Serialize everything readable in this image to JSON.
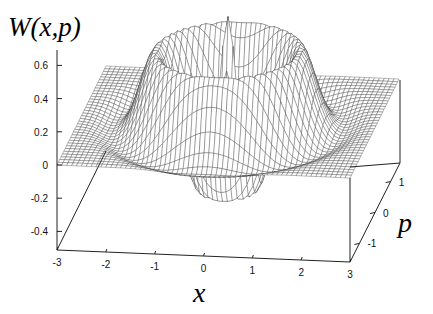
{
  "chart_data": {
    "type": "surface3d",
    "title": "",
    "zlabel": "W(x,p)",
    "xlabel": "x",
    "ylabel": "p",
    "x_ticks": [
      "-3",
      "-2",
      "-1",
      "0",
      "1",
      "2",
      "3"
    ],
    "p_ticks": [
      "-1",
      "0",
      "1"
    ],
    "z_ticks": [
      "0.6",
      "0.4",
      "0.2",
      "0",
      "-0.2",
      "-0.4"
    ],
    "xlim": [
      -3,
      3
    ],
    "ylim": [
      -1.6,
      1.6
    ],
    "zlim": [
      -0.5,
      0.7
    ],
    "grid": false,
    "style": "wireframe mesh, hidden-line removed, black lines on white",
    "features": [
      {
        "name": "central peak",
        "x": 0,
        "p": 0,
        "z": 0.7
      },
      {
        "name": "negative ring (bowl)",
        "radius": 1.0,
        "z_min": -0.45
      },
      {
        "name": "positive ring",
        "radius": 2.0,
        "z_max": 0.5
      },
      {
        "name": "far-field plateau",
        "z": 0.0
      }
    ]
  }
}
